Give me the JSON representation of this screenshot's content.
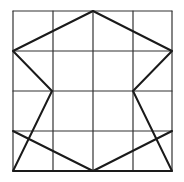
{
  "diagram": {
    "type": "grid-polygon",
    "grid": {
      "columns": 4,
      "rows": 4,
      "x_lines": [
        13,
        53,
        93,
        133,
        172
      ],
      "y_lines": [
        11,
        51,
        91,
        131,
        171
      ],
      "color": "#333333",
      "stroke_width": 1.2
    },
    "polygon": {
      "color": "#1a1a1a",
      "stroke_width": 2,
      "grid_points": [
        [
          2,
          0
        ],
        [
          4,
          1
        ],
        [
          3,
          2
        ],
        [
          4,
          4
        ],
        [
          2,
          4
        ],
        [
          0,
          4
        ],
        [
          1,
          2
        ],
        [
          0,
          1
        ]
      ],
      "points": [
        [
          93,
          11
        ],
        [
          172,
          51
        ],
        [
          133,
          91
        ],
        [
          172,
          171
        ],
        [
          93,
          171
        ],
        [
          13,
          171
        ],
        [
          52,
          91
        ],
        [
          13,
          51
        ]
      ]
    },
    "extra_lines": [
      {
        "from": [
          13,
          131
        ],
        "to": [
          93,
          171
        ]
      },
      {
        "from": [
          93,
          171
        ],
        "to": [
          172,
          131
        ]
      }
    ]
  }
}
